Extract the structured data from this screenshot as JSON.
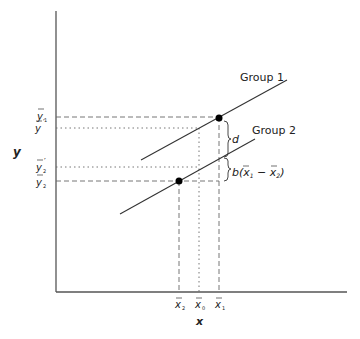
{
  "axes": {
    "x_label": "x",
    "y_label": "y"
  },
  "y_ticks": [
    {
      "symbol": "y",
      "sub": "1",
      "prime": "",
      "y": 117
    },
    {
      "symbol": "y",
      "sub": "",
      "prime": "′",
      "y": 128
    },
    {
      "symbol": "y",
      "sub": "2",
      "prime": "′",
      "y": 167
    },
    {
      "symbol": "y",
      "sub": "2",
      "prime": "",
      "y": 181
    }
  ],
  "x_ticks": [
    {
      "symbol": "x",
      "sub": "2",
      "x": 179
    },
    {
      "symbol": "x",
      "sub": "0",
      "x": 199
    },
    {
      "symbol": "x",
      "sub": "1",
      "x": 219
    }
  ],
  "lines": {
    "group1": {
      "label": "Group 1",
      "x1": 141,
      "y1": 160,
      "x2": 287,
      "y2": 80
    },
    "group2": {
      "label": "Group 2",
      "x1": 120,
      "y1": 214,
      "x2": 255,
      "y2": 139
    }
  },
  "points": [
    {
      "name": "group1-mean",
      "x": 219,
      "y": 118
    },
    {
      "name": "group2-mean",
      "x": 179,
      "y": 181
    }
  ],
  "annotations": {
    "d_label": "d",
    "b_label_prefix": "b(",
    "b_label_x1": "x",
    "b_label_sub1": "1",
    "b_label_minus": " − ",
    "b_label_x2": "x",
    "b_label_sub2": "2",
    "b_label_suffix": ")"
  },
  "colors": {
    "axis": "#555555",
    "line": "#333333",
    "guide": "#666666",
    "point": "#000000"
  }
}
